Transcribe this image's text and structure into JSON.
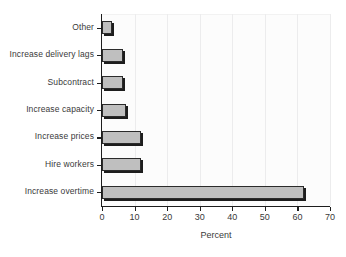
{
  "chart_data": {
    "type": "bar",
    "orientation": "horizontal",
    "title": "",
    "xlabel": "Percent",
    "ylabel": "",
    "xlim": [
      0,
      70
    ],
    "xticks": [
      0,
      10,
      20,
      30,
      40,
      50,
      60,
      70
    ],
    "grid": "vertical",
    "legend": "none",
    "categories": [
      "Other",
      "Increase delivery lags",
      "Subcontract",
      "Increase capacity",
      "Increase prices",
      "Hire workers",
      "Increase overtime"
    ],
    "values": [
      3,
      6.5,
      6.5,
      7.5,
      12,
      12,
      62
    ],
    "series": [
      {
        "name": "Percent",
        "values": [
          3,
          6.5,
          6.5,
          7.5,
          12,
          12,
          62
        ]
      }
    ],
    "bar_color": "#bfbfbf",
    "bar_edge_color": "#2b2b2b",
    "plot_background": "#fcfcfc",
    "gridline_color": "#ececed",
    "axis_color": "#1d1d1d",
    "text_color": "#3a3a3a"
  }
}
